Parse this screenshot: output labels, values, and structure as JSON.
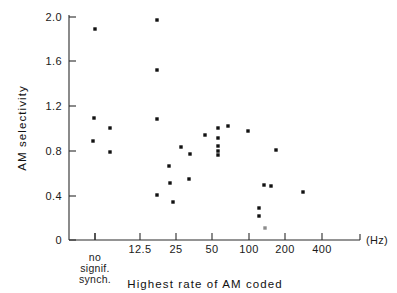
{
  "chart_data": {
    "type": "scatter",
    "title": "",
    "xlabel": "Highest rate of AM coded",
    "xunit": "(Hz)",
    "ylabel": "AM selectivity",
    "ylim": [
      0,
      2.0
    ],
    "yticks": [
      "0",
      "0.4",
      "0.8",
      "1.2",
      "1.6",
      "2.0"
    ],
    "ytick_values": [
      0,
      0.4,
      0.8,
      1.2,
      1.6,
      2.0
    ],
    "xticks": [
      "no signif. synch.",
      "12.5",
      "25",
      "50",
      "100",
      "200",
      "400"
    ],
    "xtick_kind": [
      "category",
      "log",
      "log",
      "log",
      "log",
      "log",
      "log"
    ],
    "x_category_label_lines": [
      "no",
      "signif.",
      "synch."
    ],
    "grid": false,
    "legend": null,
    "points": [
      {
        "x": "no signif. synch.",
        "y": 1.9
      },
      {
        "x": "no signif. synch.",
        "y": 1.1
      },
      {
        "x": "no signif. synch.",
        "y": 0.89
      },
      {
        "x": 9.0,
        "y": 1.0
      },
      {
        "x": 9.0,
        "y": 0.81
      },
      {
        "x": 21.0,
        "y": 2.0
      },
      {
        "x": 21.0,
        "y": 1.52
      },
      {
        "x": 21.0,
        "y": 1.1
      },
      {
        "x": 21.0,
        "y": 0.5
      },
      {
        "x": 26.0,
        "y": 0.67
      },
      {
        "x": 26.0,
        "y": 0.52
      },
      {
        "x": 26.5,
        "y": 0.34
      },
      {
        "x": 31.0,
        "y": 0.85
      },
      {
        "x": 37.0,
        "y": 0.78
      },
      {
        "x": 37.0,
        "y": 0.56
      },
      {
        "x": 46.0,
        "y": 0.91
      },
      {
        "x": 50.0,
        "y": 0.99
      },
      {
        "x": 50.0,
        "y": 0.89
      },
      {
        "x": 50.0,
        "y": 0.84
      },
      {
        "x": 50.0,
        "y": 0.8
      },
      {
        "x": 50.0,
        "y": 0.78
      },
      {
        "x": 55.0,
        "y": 1.1
      },
      {
        "x": 78.0,
        "y": 0.99
      },
      {
        "x": 93.0,
        "y": 0.3
      },
      {
        "x": 95.0,
        "y": 0.22
      },
      {
        "x": 99.0,
        "y": 0.5
      },
      {
        "x": 104.0,
        "y": 0.49
      },
      {
        "x": 100.0,
        "y": 0.1
      },
      {
        "x": 120.0,
        "y": 0.82
      },
      {
        "x": 170.0,
        "y": 0.44
      }
    ],
    "marker": {
      "shape": "square",
      "size": 3.4,
      "color": "#111111"
    }
  },
  "pixel_geometry": {
    "x_axis_y": 240,
    "y_axis_x": 69,
    "x_axis_right": 360,
    "y_top_px": 17,
    "ytick_px": [
      240,
      196,
      151,
      106,
      61,
      17
    ],
    "xtick_px": [
      95,
      140,
      176,
      212,
      249,
      285,
      322
    ],
    "points_px": [
      [
        95,
        29
      ],
      [
        94,
        118
      ],
      [
        93,
        141
      ],
      [
        110,
        128
      ],
      [
        110,
        152
      ],
      [
        157,
        20
      ],
      [
        157,
        70
      ],
      [
        157,
        119
      ],
      [
        157,
        195
      ],
      [
        169,
        166
      ],
      [
        170,
        183
      ],
      [
        173,
        202
      ],
      [
        181,
        147
      ],
      [
        190,
        154
      ],
      [
        189,
        179
      ],
      [
        205,
        135
      ],
      [
        218,
        128
      ],
      [
        218,
        138
      ],
      [
        218,
        146
      ],
      [
        218,
        151
      ],
      [
        218,
        155
      ],
      [
        228,
        126
      ],
      [
        248,
        131
      ],
      [
        259,
        208
      ],
      [
        259,
        216
      ],
      [
        264,
        185
      ],
      [
        271,
        186
      ],
      [
        265,
        228
      ],
      [
        276,
        150
      ],
      [
        303,
        192
      ]
    ]
  },
  "labels": {
    "y_axis_title": "AM  selectivity",
    "x_axis_title": "Highest  rate  of  AM  coded",
    "hz_unit": "(Hz)",
    "category_lines": [
      "no",
      "signif.",
      "synch."
    ],
    "y_ticks": [
      "2.0",
      "1.6",
      "1.2",
      "0.8",
      "0.4",
      "0"
    ],
    "x_ticks": [
      "12.5",
      "25",
      "50",
      "100",
      "200",
      "400"
    ]
  }
}
